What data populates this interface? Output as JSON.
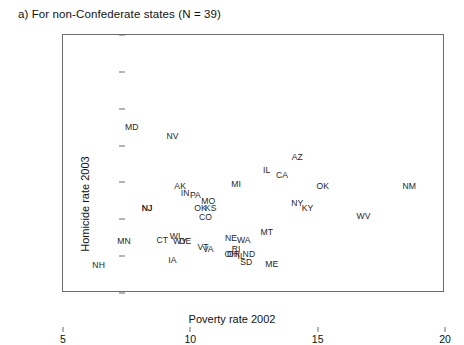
{
  "panel": {
    "title": "a) For non-Confederate states (N = 39)"
  },
  "axes": {
    "xlabel": "Poverty rate 2002",
    "ylabel": "Homicide rate 2003",
    "xticks": [
      "5",
      "10",
      "15",
      "20"
    ],
    "yticks": [
      "0",
      "2",
      "4",
      "6",
      "8",
      "10",
      "12",
      "14"
    ]
  },
  "chart_data": {
    "type": "scatter",
    "title": "a) For non-Confederate states (N = 39)",
    "xlabel": "Poverty rate 2002",
    "ylabel": "Homicide rate 2003",
    "xlim": [
      5,
      20
    ],
    "ylim": [
      0,
      14
    ],
    "xticks": [
      5,
      10,
      15,
      20
    ],
    "yticks": [
      0,
      2,
      4,
      6,
      8,
      10,
      12,
      14
    ],
    "grid": false,
    "legend": null,
    "point_rendering": "text-labels",
    "points": [
      {
        "label": "MD",
        "x": 7.7,
        "y": 9.0
      },
      {
        "label": "NV",
        "x": 9.3,
        "y": 8.5
      },
      {
        "label": "AZ",
        "x": 14.2,
        "y": 7.4
      },
      {
        "label": "IL",
        "x": 13.0,
        "y": 6.7
      },
      {
        "label": "CA",
        "x": 13.6,
        "y": 6.4
      },
      {
        "label": "MI",
        "x": 11.8,
        "y": 5.9
      },
      {
        "label": "OK",
        "x": 15.2,
        "y": 5.8
      },
      {
        "label": "NM",
        "x": 18.6,
        "y": 5.8
      },
      {
        "label": "AK",
        "x": 9.6,
        "y": 5.8
      },
      {
        "label": "IN",
        "x": 9.8,
        "y": 5.4
      },
      {
        "label": "PA",
        "x": 10.2,
        "y": 5.3
      },
      {
        "label": "MO",
        "x": 10.7,
        "y": 5.0
      },
      {
        "label": "NY",
        "x": 14.2,
        "y": 4.9
      },
      {
        "label": "KY",
        "x": 14.6,
        "y": 4.6
      },
      {
        "label": "OK",
        "x": 10.4,
        "y": 4.6
      },
      {
        "label": "KS",
        "x": 10.8,
        "y": 4.6
      },
      {
        "label": "NJ",
        "x": 8.3,
        "y": 4.6
      },
      {
        "label": "CO",
        "x": 10.6,
        "y": 4.1
      },
      {
        "label": "WV",
        "x": 16.8,
        "y": 4.2
      },
      {
        "label": "MT",
        "x": 13.0,
        "y": 3.3
      },
      {
        "label": "WI",
        "x": 9.4,
        "y": 3.1
      },
      {
        "label": "NE",
        "x": 11.6,
        "y": 3.0
      },
      {
        "label": "WA",
        "x": 12.1,
        "y": 2.9
      },
      {
        "label": "CT",
        "x": 8.9,
        "y": 2.9
      },
      {
        "label": "MN",
        "x": 7.4,
        "y": 2.8
      },
      {
        "label": "DE",
        "x": 9.8,
        "y": 2.8
      },
      {
        "label": "WY",
        "x": 9.6,
        "y": 2.8
      },
      {
        "label": "VT",
        "x": 10.5,
        "y": 2.5
      },
      {
        "label": "VA",
        "x": 10.7,
        "y": 2.4
      },
      {
        "label": "IA",
        "x": 9.3,
        "y": 1.8
      },
      {
        "label": "RI",
        "x": 11.8,
        "y": 2.4
      },
      {
        "label": "OR",
        "x": 11.7,
        "y": 2.1
      },
      {
        "label": "ND",
        "x": 12.3,
        "y": 2.1
      },
      {
        "label": "IL",
        "x": 12.0,
        "y": 2.0
      },
      {
        "label": "SD",
        "x": 12.2,
        "y": 1.7
      },
      {
        "label": "ME",
        "x": 13.2,
        "y": 1.6
      },
      {
        "label": "NH",
        "x": 6.4,
        "y": 1.5
      },
      {
        "label": "NJ",
        "x": 8.3,
        "y": 4.6
      },
      {
        "label": "OH",
        "x": 11.6,
        "y": 2.1
      }
    ]
  }
}
